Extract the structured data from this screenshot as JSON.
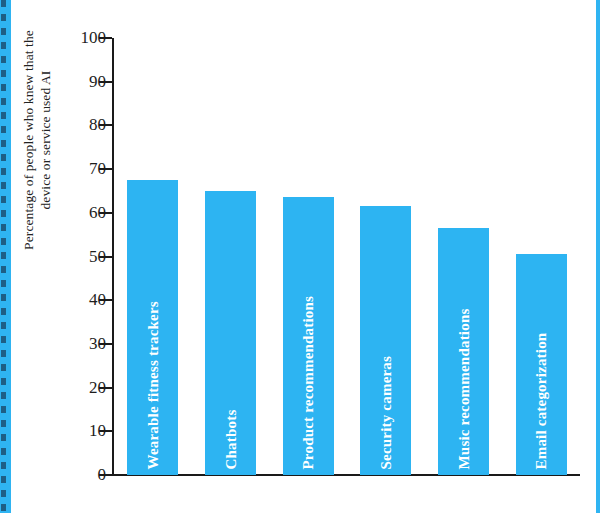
{
  "chart_data": {
    "type": "bar",
    "title": "",
    "subtitle": "",
    "xlabel": "",
    "ylabel": "Percentage of people who knew that the\ndevice or service used AI",
    "ylim": [
      0,
      100
    ],
    "yticks": [
      0,
      10,
      20,
      30,
      40,
      50,
      60,
      70,
      80,
      90,
      100
    ],
    "ytick_labels": [
      "0",
      "10",
      "20",
      "30",
      "40",
      "50",
      "60",
      "70",
      "80",
      "90",
      "100"
    ],
    "grid": false,
    "legend": false,
    "legend_position": "none",
    "bar_color": "#2DB4F2",
    "bar_label_color": "#FFFFFF",
    "axis_color": "#1A1A1A",
    "categories": [
      "Wearable fitness trackers",
      "Chatbots",
      "Product recommendations",
      "Security cameras",
      "Music recommendations",
      "Email categorization"
    ],
    "values": [
      67.5,
      65.0,
      63.7,
      61.6,
      56.5,
      50.5
    ]
  },
  "page": {
    "background_color": "#FFFFFF",
    "accent_color": "#2FB4F2",
    "edge_stripe_color": "#2FB4F2",
    "edge_dash_color": "#1B4F72"
  }
}
